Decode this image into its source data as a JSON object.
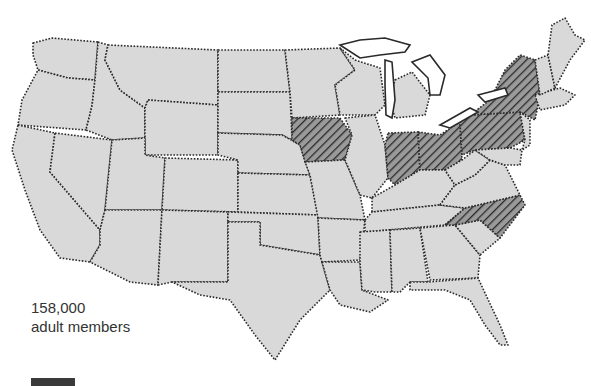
{
  "map": {
    "title": "",
    "region": "Contiguous United States",
    "fill_color": "#d9d9d9",
    "highlight_pattern": "diagonal-hatch",
    "highlighted_states": [
      "Iowa",
      "Indiana",
      "Ohio",
      "Pennsylvania",
      "New York",
      "North Carolina"
    ]
  },
  "annotation": {
    "line1": "158,000",
    "line2": "adult members"
  }
}
